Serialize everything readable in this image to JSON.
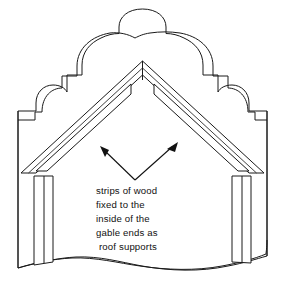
{
  "figure": {
    "background_color": "#ffffff",
    "line_color": "#1a1a1a",
    "width": 285,
    "height": 300
  },
  "caption": {
    "lines": [
      "strips of wood",
      "fixed to the",
      "inside of the",
      "gable ends as",
      "roof supports"
    ],
    "line_1": "strips of wood",
    "line_2": "fixed to the",
    "line_3": "inside of the",
    "line_4": "gable ends as",
    "line_5": "roof supports",
    "full_text": "strips of wood fixed to the inside of the gable ends as roof supports",
    "text_color": "#111111"
  },
  "annotations": {
    "left_arrow": {
      "name": "left-pointer-arrow",
      "points_to": "left roof support strip",
      "direction": "up-left"
    },
    "right_arrow": {
      "name": "right-pointer-arrow",
      "points_to": "right roof support strip",
      "direction": "up-right"
    }
  },
  "parts": {
    "gable_wall": "curvilinear stepped dutch gable end wall",
    "left_rafter": "left roof band",
    "right_rafter": "right roof band",
    "left_strip": "left strip of wood roof support",
    "right_strip": "right strip of wood roof support",
    "left_post": "left corner post",
    "right_post": "right corner post",
    "ground_edge": "undulating lower edge"
  }
}
